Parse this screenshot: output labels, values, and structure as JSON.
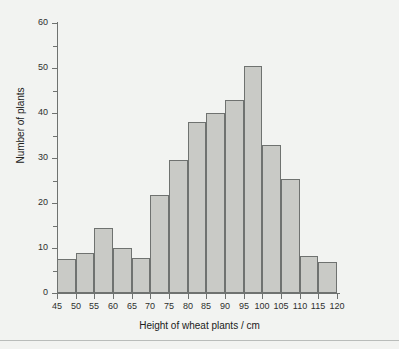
{
  "chart_data": {
    "type": "bar",
    "title": "",
    "subtitle": "",
    "xlabel": "Height of wheat plants / cm",
    "ylabel": "Number of plants",
    "xlim": [
      45,
      120
    ],
    "ylim": [
      0,
      60
    ],
    "grid": false,
    "legend": null,
    "bin_width": 5,
    "x_ticks": [
      45,
      50,
      55,
      60,
      65,
      70,
      75,
      80,
      85,
      90,
      95,
      100,
      105,
      110,
      115,
      120
    ],
    "x_tick_labels": [
      "45",
      "50",
      "55",
      "60",
      "65",
      "70",
      "75",
      "80",
      "85",
      "90",
      "95",
      "100",
      "105",
      "110",
      "115",
      "120"
    ],
    "y_ticks": [
      0,
      10,
      20,
      30,
      40,
      50,
      60
    ],
    "y_tick_labels": [
      "0",
      "10",
      "20",
      "30",
      "40",
      "50",
      "60"
    ],
    "y_minor_ticks": [
      5,
      15,
      25,
      35,
      45,
      55
    ],
    "categories": [
      "45-50",
      "50-55",
      "55-60",
      "60-65",
      "65-70",
      "70-75",
      "75-80",
      "80-85",
      "85-90",
      "90-95",
      "95-100",
      "100-105",
      "105-110",
      "110-115",
      "115-120"
    ],
    "bin_edges": [
      45,
      50,
      55,
      60,
      65,
      70,
      75,
      80,
      85,
      90,
      95,
      100,
      105,
      110,
      115,
      120
    ],
    "values": [
      7.5,
      9,
      14.5,
      10,
      7.8,
      21.7,
      29.5,
      38,
      40,
      43,
      50.5,
      33,
      25.3,
      8.3,
      6.8
    ],
    "bars": [
      {
        "label": "45-50",
        "x0": 45,
        "x1": 50,
        "value": 7.5
      },
      {
        "label": "50-55",
        "x0": 50,
        "x1": 55,
        "value": 9
      },
      {
        "label": "55-60",
        "x0": 55,
        "x1": 60,
        "value": 14.5
      },
      {
        "label": "60-65",
        "x0": 60,
        "x1": 65,
        "value": 10
      },
      {
        "label": "65-70",
        "x0": 65,
        "x1": 70,
        "value": 7.8
      },
      {
        "label": "70-75",
        "x0": 70,
        "x1": 75,
        "value": 21.7
      },
      {
        "label": "75-80",
        "x0": 75,
        "x1": 80,
        "value": 29.5
      },
      {
        "label": "80-85",
        "x0": 80,
        "x1": 85,
        "value": 38
      },
      {
        "label": "85-90",
        "x0": 85,
        "x1": 90,
        "value": 40
      },
      {
        "label": "90-95",
        "x0": 90,
        "x1": 95,
        "value": 43
      },
      {
        "label": "95-100",
        "x0": 95,
        "x1": 100,
        "value": 50.5
      },
      {
        "label": "100-105",
        "x0": 100,
        "x1": 105,
        "value": 33
      },
      {
        "label": "105-110",
        "x0": 105,
        "x1": 110,
        "value": 25.3
      },
      {
        "label": "110-115",
        "x0": 110,
        "x1": 115,
        "value": 8.3
      },
      {
        "label": "115-120",
        "x0": 115,
        "x1": 120,
        "value": 6.8
      }
    ],
    "colors": {
      "bar_fill": "#c9cac6",
      "bar_border": "#6f7270",
      "axis": "#6f7270",
      "text": "#202120",
      "background": "#f2f3f1",
      "rule": "#b9bcba"
    }
  }
}
